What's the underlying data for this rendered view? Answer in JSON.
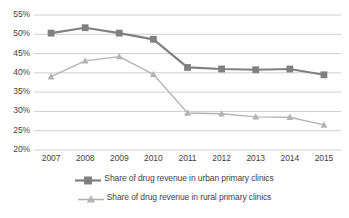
{
  "chart_data": {
    "type": "line",
    "title": "",
    "xlabel": "",
    "ylabel": "",
    "categories": [
      "2007",
      "2008",
      "2009",
      "2010",
      "2011",
      "2012",
      "2013",
      "2014",
      "2015"
    ],
    "ylim": [
      20,
      55
    ],
    "ytick_labels": [
      "20%",
      "25%",
      "30%",
      "35%",
      "40%",
      "45%",
      "50%",
      "55%"
    ],
    "ytick_values": [
      20,
      25,
      30,
      35,
      40,
      45,
      50,
      55
    ],
    "grid": true,
    "legend_position": "bottom",
    "series": [
      {
        "name": "Share of drug revenue in urban primary clinics",
        "marker": "square",
        "color": "#808080",
        "values": [
          50.3,
          51.7,
          50.3,
          48.7,
          41.4,
          41.0,
          40.8,
          41.0,
          39.5
        ]
      },
      {
        "name": "Share of drug revenue in rural primary clinics",
        "marker": "triangle",
        "color": "#b3b3b3",
        "values": [
          39.0,
          43.1,
          44.2,
          39.6,
          29.6,
          29.4,
          28.6,
          28.5,
          26.5
        ]
      }
    ]
  },
  "axis": {
    "y_labels": [
      "55%",
      "50%",
      "45%",
      "40%",
      "35%",
      "30%",
      "25%",
      "20%"
    ],
    "x_labels": [
      "2007",
      "2008",
      "2009",
      "2010",
      "2011",
      "2012",
      "2013",
      "2014",
      "2015"
    ]
  },
  "legend": {
    "items": [
      {
        "label": "Share of drug revenue in urban primary clinics"
      },
      {
        "label": "Share of drug revenue in rural primary clinics"
      }
    ]
  },
  "colors": {
    "urban": "#808080",
    "rural": "#b3b3b3",
    "grid": "#c8c8c8",
    "text": "#3f3f3f"
  }
}
